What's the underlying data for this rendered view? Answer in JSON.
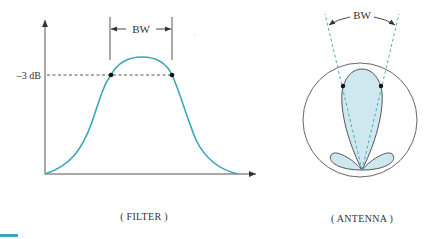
{
  "figure": {
    "panels": [
      {
        "id": "filter",
        "caption": "( FILTER )",
        "bandwidth_label": "BW",
        "level_label": "–3 dB",
        "curve_color": "#3aa6b9",
        "axis_color": "#555555"
      },
      {
        "id": "antenna",
        "caption": "( ANTENNA )",
        "bandwidth_label": "BW",
        "lobe_fill": "#cfe7ee",
        "dashed_color": "#3aa6b9",
        "outline_color": "#444444"
      }
    ]
  }
}
